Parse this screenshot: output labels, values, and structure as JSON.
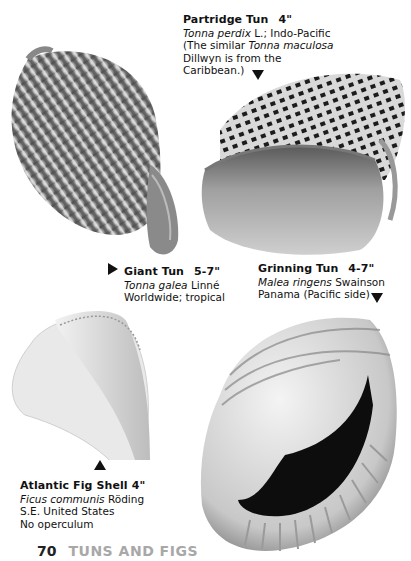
{
  "page": {
    "number": "70",
    "section": "TUNS AND FIGS"
  },
  "shells": [
    {
      "name": "Partridge Tun",
      "size": "4\"",
      "scientific": "Tonna perdix",
      "author": "L.; Indo-Pacific",
      "note_lines": [
        "(The similar ",
        "Tonna maculosa",
        "Dillwyn is from the",
        "Caribbean.)"
      ],
      "arrow": "down"
    },
    {
      "name": "Giant Tun",
      "size": "5-7\"",
      "scientific": "Tonna galea",
      "author": "Linné",
      "range": "Worldwide; tropical",
      "arrow": "right"
    },
    {
      "name": "Grinning Tun",
      "size": "4-7\"",
      "scientific": "Malea ringens",
      "author": "Swainson",
      "range": "Panama (Pacific side)",
      "arrow": "down"
    },
    {
      "name": "Atlantic Fig Shell",
      "size": "4\"",
      "scientific": "Ficus communis",
      "author": "Röding",
      "range": "S.E. United States",
      "extra": "No operculum",
      "arrow": "up"
    }
  ]
}
